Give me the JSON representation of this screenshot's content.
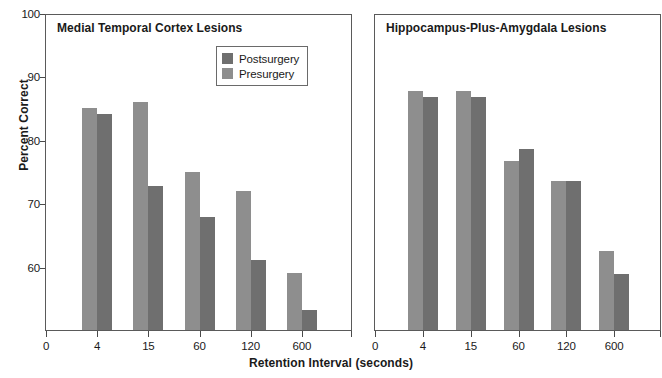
{
  "chart_data": {
    "type": "bar",
    "title": "",
    "xlabel": "Retention Interval (seconds)",
    "ylabel": "Percent Correct",
    "ylim": [
      50,
      100
    ],
    "yticks": [
      60,
      70,
      80,
      90,
      100
    ],
    "xticks": [
      "0",
      "4",
      "15",
      "60",
      "120",
      "600"
    ],
    "categories": [
      "4",
      "15",
      "60",
      "120",
      "600"
    ],
    "grid": false,
    "legend_position": "upper-right-of-left-panel",
    "legend": [
      {
        "label": "Postsurgery",
        "color": "#6f6f6f"
      },
      {
        "label": "Presurgery",
        "color": "#8e8e8e"
      }
    ],
    "panels": [
      {
        "title": "Medial Temporal Cortex Lesions",
        "series": [
          {
            "name": "Presurgery",
            "values": [
              85.0,
              86.0,
              74.9,
              72.0,
              59.0
            ]
          },
          {
            "name": "Postsurgery",
            "values": [
              84.0,
              72.7,
              67.8,
              61.0,
              53.2
            ]
          }
        ]
      },
      {
        "title": "Hippocampus-Plus-Amygdala Lesions",
        "series": [
          {
            "name": "Presurgery",
            "values": [
              87.7,
              87.7,
              76.7,
              73.5,
              62.5
            ]
          },
          {
            "name": "Postsurgery",
            "values": [
              86.8,
              86.7,
              78.5,
              73.5,
              58.8
            ]
          }
        ]
      }
    ]
  },
  "colors": {
    "presurgery": "#8e8e8e",
    "postsurgery": "#6f6f6f",
    "axis": "#555555",
    "text": "#1a1a1a"
  }
}
